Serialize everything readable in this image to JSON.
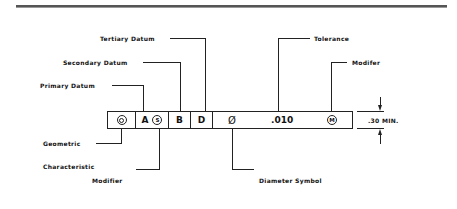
{
  "diagram": {
    "labels": {
      "tertiary_datum": "Tertiary Datum",
      "secondary_datum": "Secondary Datum",
      "primary_datum": "Primary Datum",
      "tolerance": "Tolerance",
      "modifier_top": "Modifer",
      "geometric_characteristic_line1": "Geometric",
      "geometric_characteristic_line2": "Characteristic",
      "modifier_bottom": "Modifier",
      "diameter_symbol": "Diameter Symbol",
      "height_dimension": ".30 MIN."
    },
    "frame": {
      "geometric_symbol": "concentricity-icon",
      "primary_datum": "A",
      "primary_modifier": "S",
      "secondary_datum": "B",
      "tertiary_datum": "D",
      "diameter_glyph": "Ø",
      "tolerance_value": ".010",
      "tolerance_modifier": "M"
    }
  }
}
